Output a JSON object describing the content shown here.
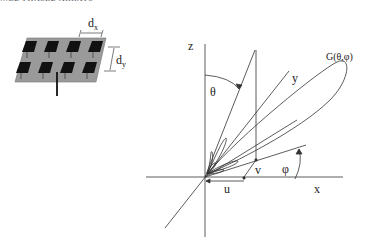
{
  "header": {
    "cropped_text": "…ED PHASED ARRAYS"
  },
  "array_figure": {
    "title": "Planar patch antenna array",
    "rows": 2,
    "columns": 4,
    "labels": {
      "dx": "d",
      "dx_sub": "x",
      "dy": "d",
      "dy_sub": "y"
    },
    "colors": {
      "substrate": "#9a9a9a",
      "patch": "#111111"
    }
  },
  "coordinate_figure": {
    "axes": {
      "z": "z",
      "x": "x",
      "y": "y"
    },
    "angles": {
      "theta": "θ",
      "phi": "φ"
    },
    "projections": {
      "u": "u",
      "v": "v"
    },
    "pattern_label": "G(θ,φ)",
    "colors": {
      "line": "#333333"
    }
  }
}
